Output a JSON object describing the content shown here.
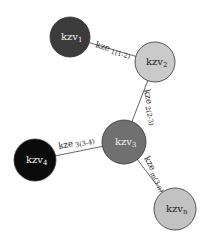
{
  "diagram": {
    "type": "network-graph",
    "nodes": [
      {
        "id": "kzv1",
        "base": "kzv",
        "sub": "1",
        "cx": 70,
        "cy": 37,
        "r": 20,
        "fill": "#3b3b3b",
        "text_color": "#f2f2f2"
      },
      {
        "id": "kzv2",
        "base": "kzv",
        "sub": "2",
        "cx": 155,
        "cy": 62,
        "r": 20,
        "fill": "#cacaca",
        "text_color": "#222222"
      },
      {
        "id": "kzv3",
        "base": "kzv",
        "sub": "3",
        "cx": 124,
        "cy": 142,
        "r": 22,
        "fill": "#707070",
        "text_color": "#f0f0f0"
      },
      {
        "id": "kzv4",
        "base": "kzv",
        "sub": "4",
        "cx": 35,
        "cy": 160,
        "r": 21,
        "fill": "#0b0b0b",
        "text_color": "#f2f2f2"
      },
      {
        "id": "kzvn",
        "base": "kzv",
        "sub": "n",
        "cx": 175,
        "cy": 209,
        "r": 21,
        "fill": "#c2c2c2",
        "text_color": "#222222"
      }
    ],
    "edges": [
      {
        "id": "e12",
        "from": "kzv1",
        "to": "kzv2",
        "base": "kze",
        "sub": "1(1-2)",
        "label_x": 95,
        "label_y": 47,
        "angle": 16
      },
      {
        "id": "e23",
        "from": "kzv2",
        "to": "kzv3",
        "base": "kze",
        "sub": "2(2-3)",
        "label_x": 144,
        "label_y": 90,
        "angle": 78
      },
      {
        "id": "e34",
        "from": "kzv3",
        "to": "kzv4",
        "base": "kze",
        "sub": "3(3-4)",
        "label_x": 59,
        "label_y": 149,
        "angle": -12
      },
      {
        "id": "e3n",
        "from": "kzv3",
        "to": "kzvn",
        "base": "kze",
        "sub": "m(3-n)",
        "label_x": 144,
        "label_y": 158,
        "angle": 62
      }
    ],
    "edge_color": "#555555"
  }
}
